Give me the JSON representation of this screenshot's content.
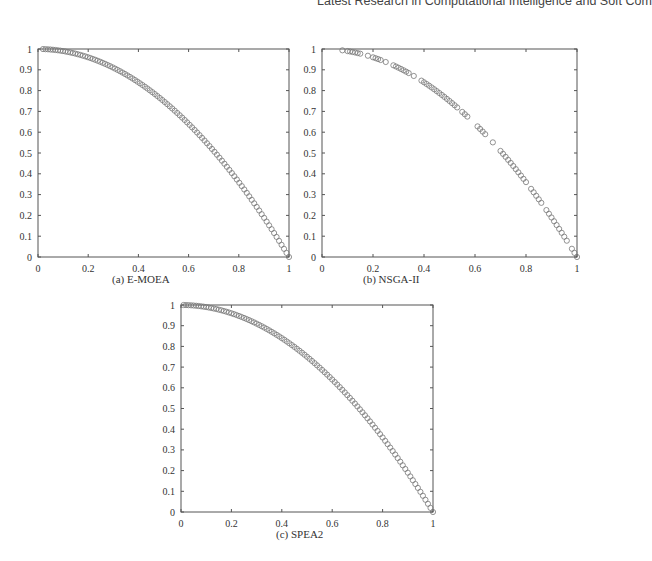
{
  "header": {
    "running_title": "Latest Research in Computational Intelligence and Soft Com"
  },
  "panels": [
    {
      "id": "a",
      "caption": "(a) E-MOEA",
      "frame": {
        "left": 38,
        "top": 49,
        "right": 289,
        "bottom": 257
      },
      "caption_pos": {
        "left": 112,
        "top": 273
      }
    },
    {
      "id": "b",
      "caption": "(b) NSGA-II",
      "frame": {
        "left": 322,
        "top": 49,
        "right": 577,
        "bottom": 257
      },
      "caption_pos": {
        "left": 363,
        "top": 273
      }
    },
    {
      "id": "c",
      "caption": "(c) SPEA2",
      "frame": {
        "left": 181,
        "top": 305,
        "right": 433,
        "bottom": 512
      },
      "caption_pos": {
        "left": 276,
        "top": 528
      }
    }
  ],
  "style": {
    "marker_color": "#777777",
    "axis_color": "#555555"
  },
  "chart_data": [
    {
      "type": "scatter",
      "title": "(a) E-MOEA",
      "xlabel": "",
      "ylabel": "",
      "xlim": [
        0,
        1
      ],
      "ylim": [
        0,
        1
      ],
      "xticks": [
        "0",
        "0.2",
        "0.4",
        "0.6",
        "0.8",
        "1"
      ],
      "yticks": [
        "0",
        "0.1",
        "0.2",
        "0.3",
        "0.4",
        "0.5",
        "0.6",
        "0.7",
        "0.8",
        "0.9",
        "1"
      ],
      "grid": false,
      "marker": "open-circle",
      "curve": "y = 1 - x^2",
      "x_range": [
        0.02,
        1.0
      ],
      "n_points": 100,
      "distribution": "uniform, dense"
    },
    {
      "type": "scatter",
      "title": "(b) NSGA-II",
      "xlabel": "",
      "ylabel": "",
      "xlim": [
        0,
        1
      ],
      "ylim": [
        0,
        1
      ],
      "xticks": [
        "0",
        "0.2",
        "0.4",
        "0.6",
        "0.8",
        "1"
      ],
      "yticks": [
        "0",
        "0.1",
        "0.2",
        "0.3",
        "0.4",
        "0.5",
        "0.6",
        "0.7",
        "0.8",
        "0.9",
        "1"
      ],
      "grid": false,
      "marker": "open-circle",
      "curve": "y = 1 - x^2",
      "x_values": [
        0.08,
        0.1,
        0.11,
        0.12,
        0.13,
        0.14,
        0.15,
        0.18,
        0.2,
        0.21,
        0.22,
        0.23,
        0.25,
        0.28,
        0.29,
        0.3,
        0.31,
        0.32,
        0.33,
        0.34,
        0.36,
        0.39,
        0.4,
        0.41,
        0.42,
        0.43,
        0.44,
        0.45,
        0.46,
        0.47,
        0.48,
        0.49,
        0.5,
        0.51,
        0.52,
        0.53,
        0.55,
        0.56,
        0.57,
        0.61,
        0.62,
        0.63,
        0.64,
        0.67,
        0.7,
        0.71,
        0.72,
        0.73,
        0.74,
        0.75,
        0.76,
        0.77,
        0.78,
        0.79,
        0.8,
        0.82,
        0.83,
        0.84,
        0.85,
        0.86,
        0.88,
        0.89,
        0.9,
        0.91,
        0.92,
        0.93,
        0.94,
        0.95,
        0.96,
        0.98,
        0.99,
        1.0
      ]
    },
    {
      "type": "scatter",
      "title": "(c) SPEA2",
      "xlabel": "",
      "ylabel": "",
      "xlim": [
        0,
        1
      ],
      "ylim": [
        0,
        1
      ],
      "xticks": [
        "0",
        "0.2",
        "0.4",
        "0.6",
        "0.8",
        "1"
      ],
      "yticks": [
        "0",
        "0.1",
        "0.2",
        "0.3",
        "0.4",
        "0.5",
        "0.6",
        "0.7",
        "0.8",
        "0.9",
        "1"
      ],
      "grid": false,
      "marker": "open-circle",
      "curve": "y = 1 - x^2",
      "x_range": [
        0.01,
        1.0
      ],
      "n_points": 100,
      "distribution": "uniform, dense"
    }
  ]
}
